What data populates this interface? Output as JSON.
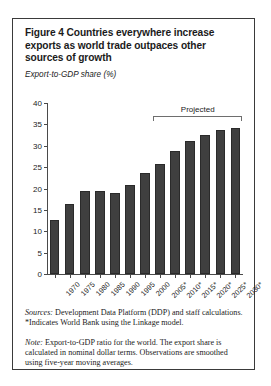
{
  "figure": {
    "title": "Figure 4  Countries everywhere increase exports as world trade outpaces other sources of growth",
    "axis_caption": "Export-to-GDP share (%)",
    "projected_label": "Projected",
    "sources_lead": "Sources:",
    "sources_text": " Development Data Platform (DDP) and staff calculations. *Indicates World Bank using the Linkage model.",
    "note_lead": "Note:",
    "note_text": " Export-to-GDP ratio for the world. The export share is calculated in nominal dollar terms. Observations are smoothed using five-year moving averages."
  },
  "chart_data": {
    "type": "bar",
    "title": "Figure 4  Countries everywhere increase exports as world trade outpaces other sources of growth",
    "xlabel": "",
    "ylabel": "Export-to-GDP share (%)",
    "ylim": [
      0,
      40
    ],
    "yticks": [
      0,
      5,
      10,
      15,
      20,
      25,
      30,
      35,
      40
    ],
    "grid": false,
    "legend": "none",
    "categories": [
      "1970",
      "1975",
      "1980",
      "1985",
      "1990",
      "1995",
      "2000",
      "2005*",
      "2010*",
      "2015*",
      "2020*",
      "2025*",
      "2030*"
    ],
    "values": [
      12.7,
      16.4,
      19.4,
      19.4,
      19.0,
      20.8,
      23.6,
      25.7,
      28.7,
      31.0,
      32.5,
      33.6,
      34.2
    ],
    "bar_color": "#3f3f3f",
    "annotations": [
      {
        "text": "Projected",
        "type": "bracket",
        "from_category": "2005*",
        "to_category": "2030*"
      }
    ]
  }
}
